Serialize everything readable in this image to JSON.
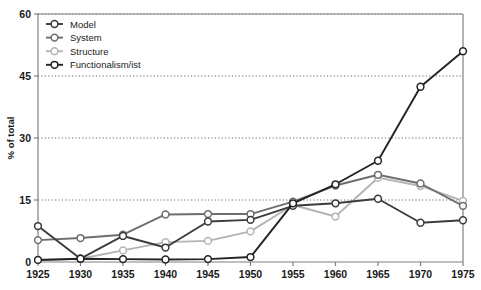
{
  "chart_data": {
    "type": "line",
    "title": "",
    "xlabel": "",
    "ylabel": "% of total",
    "x": [
      1925,
      1930,
      1935,
      1940,
      1945,
      1950,
      1955,
      1960,
      1965,
      1970,
      1975
    ],
    "xlim": [
      1925,
      1975
    ],
    "ylim": [
      0,
      60
    ],
    "yticks": [
      0,
      15,
      30,
      45,
      60
    ],
    "ytick_labels": [
      "0",
      "15",
      "30",
      "45",
      "60"
    ],
    "xtick_labels": [
      "1925",
      "1930",
      "1935",
      "1940",
      "1945",
      "1950",
      "1955",
      "1960",
      "1965",
      "1970",
      "1975"
    ],
    "grid": "horizontal-dotted",
    "legend_position": "top-left",
    "series": [
      {
        "name": "Model",
        "color": "#3c3c3c",
        "values": [
          8.7,
          0.8,
          6.3,
          3.5,
          9.8,
          10.2,
          13.6,
          14.2,
          15.3,
          9.5,
          10.1
        ]
      },
      {
        "name": "System",
        "color": "#6e6e6e",
        "values": [
          5.3,
          5.8,
          6.6,
          11.5,
          11.6,
          11.6,
          14.6,
          18.5,
          21.1,
          19.0,
          13.6
        ]
      },
      {
        "name": "Structure",
        "color": "#b4b4b4",
        "values": [
          0.5,
          0.8,
          2.8,
          4.8,
          5.1,
          7.4,
          13.8,
          11.0,
          20.4,
          18.4,
          14.8
        ]
      },
      {
        "name": "Functionalism/ist",
        "color": "#232323",
        "values": [
          0.5,
          0.8,
          0.7,
          0.6,
          0.7,
          1.2,
          14.2,
          18.8,
          24.5,
          42.4,
          51.0
        ]
      }
    ],
    "axis_color": "#808080",
    "grid_color": "#5a5a5a",
    "marker": "open-circle",
    "marker_fill": "#ffffff"
  },
  "legend": {
    "items": [
      {
        "label": "Model",
        "swatch": "legend-marker-model"
      },
      {
        "label": "System",
        "swatch": "legend-marker-system"
      },
      {
        "label": "Structure",
        "swatch": "legend-marker-structure"
      },
      {
        "label": "Functionalism/ist",
        "swatch": "legend-marker-functionalism"
      }
    ]
  }
}
